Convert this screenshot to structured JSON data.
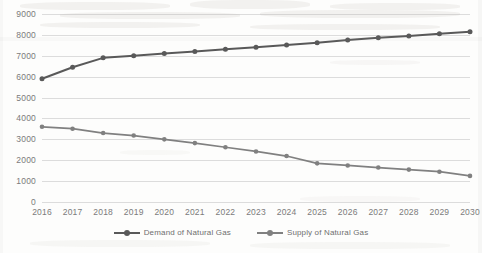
{
  "chart_data": {
    "type": "line",
    "title": "",
    "subtitle": "",
    "xlabel": "",
    "ylabel": "",
    "grid": "horizontal",
    "legend_position": "bottom-center",
    "categories": [
      "2016",
      "2017",
      "2018",
      "2019",
      "2020",
      "2021",
      "2022",
      "2023",
      "2024",
      "2025",
      "2026",
      "2027",
      "2028",
      "2029",
      "2030"
    ],
    "ylim": [
      0,
      9000
    ],
    "yticks": [
      "9000",
      "8000",
      "7000",
      "6000",
      "5000",
      "4000",
      "3000",
      "2000",
      "1000",
      "0"
    ],
    "ytick_values": [
      9000,
      8000,
      7000,
      6000,
      5000,
      4000,
      3000,
      2000,
      1000,
      0
    ],
    "series": [
      {
        "name": "Demand of Natural Gas",
        "color": "#595959",
        "marker": "circle",
        "values": [
          5900,
          6450,
          6900,
          7000,
          7110,
          7210,
          7310,
          7410,
          7520,
          7620,
          7750,
          7860,
          7950,
          8050,
          8150
        ]
      },
      {
        "name": "Supply of Natural Gas",
        "color": "#808080",
        "marker": "circle",
        "values": [
          3600,
          3510,
          3300,
          3180,
          3000,
          2820,
          2620,
          2420,
          2200,
          1850,
          1750,
          1650,
          1550,
          1450,
          1250
        ]
      }
    ]
  },
  "legend": {
    "items": [
      {
        "label": "Demand of Natural Gas"
      },
      {
        "label": "Supply of Natural Gas"
      }
    ]
  },
  "colors": {
    "demand": "#595959",
    "supply": "#808080",
    "gridline": "#dcdcdc",
    "axis_text": "#7b7b7b",
    "background": "#fdfdfc"
  }
}
